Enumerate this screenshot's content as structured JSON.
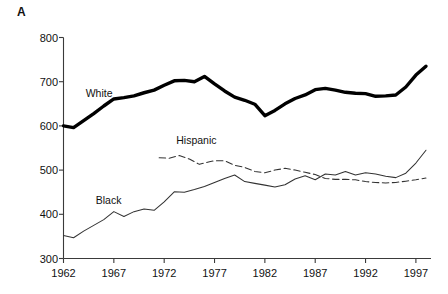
{
  "panel": {
    "label": "A"
  },
  "chart_data": {
    "type": "line",
    "title": "",
    "subtitle": "",
    "xlabel": "",
    "ylabel": "",
    "xlim": [
      1962,
      1998.5
    ],
    "ylim": [
      300,
      800
    ],
    "grid": false,
    "legend_position": "inline-labels",
    "y_ticks": [
      300,
      400,
      500,
      600,
      700,
      800
    ],
    "y_tick_labels": [
      "300",
      "400",
      "500",
      "600",
      "700",
      "800"
    ],
    "x_ticks": [
      1962,
      1967,
      1972,
      1977,
      1982,
      1987,
      1992,
      1997
    ],
    "x_tick_labels": [
      "1962",
      "1967",
      "1972",
      "1977",
      "1982",
      "1987",
      "1992",
      "1997"
    ],
    "series": [
      {
        "name": "White",
        "style": "solid-thick",
        "color": "#000000",
        "label_x": 1964.2,
        "label_y": 672,
        "x": [
          1962,
          1963,
          1964,
          1965,
          1966,
          1967,
          1968,
          1969,
          1970,
          1971,
          1972,
          1973,
          1974,
          1975,
          1976,
          1977,
          1978,
          1979,
          1980,
          1981,
          1982,
          1983,
          1984,
          1985,
          1986,
          1987,
          1988,
          1989,
          1990,
          1991,
          1992,
          1993,
          1994,
          1995,
          1996,
          1997,
          1998
        ],
        "values": [
          600,
          596,
          612,
          628,
          645,
          661,
          664,
          668,
          675,
          681,
          692,
          702,
          703,
          700,
          712,
          695,
          679,
          665,
          658,
          649,
          623,
          635,
          650,
          662,
          670,
          682,
          685,
          681,
          676,
          674,
          673,
          667,
          668,
          670,
          688,
          715,
          735
        ]
      },
      {
        "name": "Black",
        "style": "solid-thin",
        "color": "#333333",
        "label_x": 1965.2,
        "label_y": 430,
        "x": [
          1962,
          1963,
          1964,
          1965,
          1966,
          1967,
          1968,
          1969,
          1970,
          1971,
          1972,
          1973,
          1974,
          1975,
          1976,
          1977,
          1978,
          1979,
          1980,
          1981,
          1982,
          1983,
          1984,
          1985,
          1986,
          1987,
          1988,
          1989,
          1990,
          1991,
          1992,
          1993,
          1994,
          1995,
          1996,
          1997,
          1998
        ],
        "values": [
          352,
          347,
          362,
          375,
          388,
          406,
          395,
          406,
          412,
          409,
          428,
          451,
          450,
          456,
          463,
          472,
          481,
          489,
          474,
          470,
          466,
          462,
          467,
          480,
          487,
          478,
          491,
          489,
          497,
          489,
          494,
          491,
          486,
          483,
          493,
          516,
          545
        ]
      },
      {
        "name": "Hispanic",
        "style": "dashed",
        "color": "#333333",
        "label_x": 1973.2,
        "label_y": 566,
        "x": [
          1971.5,
          1972.5,
          1973.5,
          1974.5,
          1975.5,
          1976.5,
          1977,
          1978,
          1979,
          1980,
          1981,
          1982,
          1983,
          1984,
          1985,
          1986,
          1987,
          1988,
          1989,
          1990,
          1991,
          1992,
          1993,
          1994,
          1995,
          1996,
          1997,
          1998
        ],
        "values": [
          528,
          527,
          533,
          525,
          513,
          519,
          521,
          521,
          511,
          506,
          497,
          494,
          500,
          504,
          500,
          495,
          490,
          481,
          479,
          479,
          478,
          474,
          472,
          471,
          472,
          475,
          478,
          482
        ]
      }
    ]
  }
}
